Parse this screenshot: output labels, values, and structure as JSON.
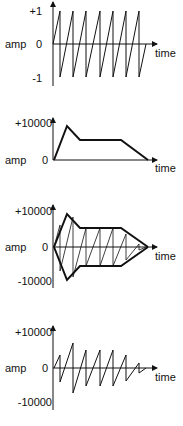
{
  "panels": [
    {
      "id": "sawtooth",
      "ylabel": "amp",
      "ymax": "+1",
      "zero": "0",
      "ymin": "-1",
      "xlabel": "time"
    },
    {
      "id": "envelope",
      "ylabel": "amp",
      "ymax": "+10000",
      "zero": "0",
      "xlabel": "time"
    },
    {
      "id": "envelope-overlay",
      "ylabel": "amp",
      "ymax": "+10000",
      "zero": "0",
      "ymin": "-10000",
      "xlabel": "time"
    },
    {
      "id": "enveloped-sawtooth",
      "ylabel": "amp",
      "ymax": "+10000",
      "zero": "0",
      "ymin": "-10000",
      "xlabel": "time"
    }
  ],
  "colors": {
    "line": "#111111",
    "background": "#ffffff"
  }
}
